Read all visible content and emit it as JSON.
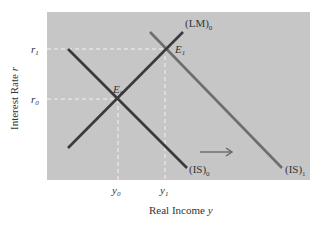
{
  "diagram": {
    "colors": {
      "plot_background": "#c6c6c6",
      "is0_line": "#3a3a3a",
      "lm0_line": "#3a3a3a",
      "is1_line": "#6e6e6e",
      "guide_lines": "#f2f2f2",
      "arrow": "#666666",
      "text": "#333333"
    },
    "axes": {
      "x_label": "Real Income",
      "x_label_var": "y",
      "y_label": "Interest Rate",
      "y_label_var": "r",
      "x_ticks": [
        {
          "base": "y",
          "sub": "0"
        },
        {
          "base": "y",
          "sub": "1"
        }
      ],
      "y_ticks": [
        {
          "base": "r",
          "sub": "1"
        },
        {
          "base": "r",
          "sub": "0"
        }
      ]
    },
    "curves": [
      {
        "id": "IS0",
        "label_base": "(IS)",
        "label_sub": "0",
        "from": [
          68,
          49
        ],
        "to": [
          187,
          168
        ]
      },
      {
        "id": "LM0",
        "label_base": "(LM)",
        "label_sub": "0",
        "from": [
          68,
          148
        ],
        "to": [
          183,
          32
        ]
      },
      {
        "id": "IS1",
        "label_base": "(IS)",
        "label_sub": "1",
        "from": [
          150,
          32
        ],
        "to": [
          282,
          168
        ]
      }
    ],
    "equilibria": [
      {
        "label_base": "E",
        "label_sub": "0",
        "x": 118,
        "y": 99
      },
      {
        "label_base": "E",
        "label_sub": "1",
        "x": 165,
        "y": 49
      }
    ],
    "shift_arrow": {
      "direction": "right",
      "from": [
        200,
        152
      ],
      "to": [
        232,
        152
      ]
    }
  }
}
